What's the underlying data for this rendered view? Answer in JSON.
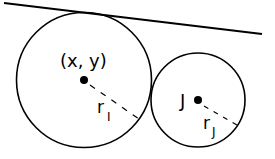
{
  "diagram": {
    "labels": {
      "circle_i_center": "(x, y)",
      "radius_i": "r",
      "radius_i_sub": "I",
      "circle_j_center": "J",
      "radius_j": "r",
      "radius_j_sub": "J"
    },
    "colors": {
      "stroke": "#000000",
      "background": "#ffffff"
    }
  }
}
